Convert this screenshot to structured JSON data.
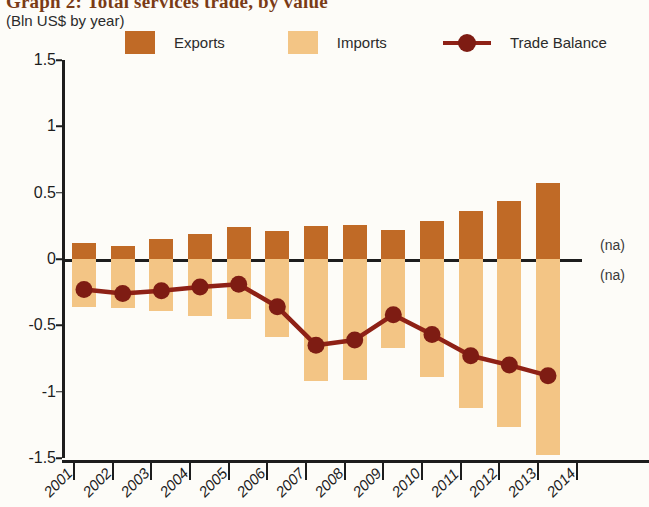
{
  "header": {
    "title": "Graph 2: Total services trade, by value",
    "subtitle": "(Bln US$ by year)"
  },
  "legend": {
    "items": [
      {
        "label": "Exports",
        "type": "swatch",
        "color": "#c06a26"
      },
      {
        "label": "Imports",
        "type": "swatch",
        "color": "#f3c585"
      },
      {
        "label": "Trade Balance",
        "type": "line",
        "color": "#8e2116"
      }
    ]
  },
  "annotations": {
    "na_upper": "(na)",
    "na_lower": "(na)"
  },
  "chart_data": {
    "type": "bar",
    "title": "Graph 2: Total services trade, by value",
    "subtitle": "(Bln US$ by year)",
    "xlabel": "",
    "ylabel": "Bln US$ by year",
    "ylim": [
      -1.5,
      1.5
    ],
    "yticks": [
      1.5,
      1,
      0.5,
      0,
      -0.5,
      -1,
      -1.5
    ],
    "ytick_labels": [
      "1.5",
      "1",
      "0.5",
      "0",
      "-0.5",
      "-1",
      "-1.5"
    ],
    "categories": [
      "2001",
      "2002",
      "2003",
      "2004",
      "2005",
      "2006",
      "2007",
      "2008",
      "2009",
      "2010",
      "2011",
      "2012",
      "2013"
    ],
    "xtick_labels": [
      "2001",
      "2002",
      "2003",
      "2004",
      "2005",
      "2006",
      "2007",
      "2008",
      "2009",
      "2010",
      "2011",
      "2012",
      "2013",
      "2014"
    ],
    "grid": false,
    "legend_position": "top",
    "series": [
      {
        "name": "Exports",
        "type": "bar",
        "color": "#c06a26",
        "values": [
          0.12,
          0.1,
          0.15,
          0.19,
          0.24,
          0.21,
          0.25,
          0.26,
          0.22,
          0.29,
          0.36,
          0.44,
          0.57
        ]
      },
      {
        "name": "Imports",
        "type": "bar",
        "color": "#f3c585",
        "values": [
          -0.36,
          -0.37,
          -0.39,
          -0.43,
          -0.45,
          -0.59,
          -0.92,
          -0.91,
          -0.67,
          -0.89,
          -1.12,
          -1.27,
          -1.48
        ]
      },
      {
        "name": "Trade Balance",
        "type": "line",
        "color": "#8e2116",
        "values": [
          -0.23,
          -0.26,
          -0.24,
          -0.21,
          -0.19,
          -0.36,
          -0.65,
          -0.61,
          -0.42,
          -0.57,
          -0.73,
          -0.8,
          -0.88
        ]
      }
    ]
  }
}
